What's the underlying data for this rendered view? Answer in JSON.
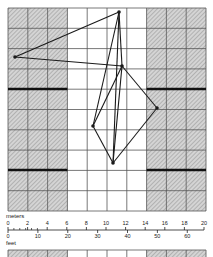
{
  "grid": {
    "left": 8,
    "top": 8,
    "right": 206,
    "bottom": 211,
    "cols": 10,
    "rows": 10,
    "hatched_columns_left": [
      0,
      1,
      2
    ],
    "hatched_columns_right": [
      7,
      8,
      9
    ],
    "bold_rows_y": [
      89,
      170
    ],
    "hatch_color": "#b8b8b8",
    "line_color": "#555555"
  },
  "figure": {
    "vertices": [
      {
        "id": "top",
        "x": 119,
        "y": 12
      },
      {
        "id": "left",
        "x": 15,
        "y": 57
      },
      {
        "id": "center",
        "x": 122,
        "y": 66
      },
      {
        "id": "right",
        "x": 157,
        "y": 108
      },
      {
        "id": "mid-left",
        "x": 93,
        "y": 126
      },
      {
        "id": "bottom",
        "x": 113,
        "y": 163
      }
    ],
    "edges": [
      [
        "top",
        "left"
      ],
      [
        "left",
        "center"
      ],
      [
        "top",
        "center"
      ],
      [
        "top",
        "mid-left"
      ],
      [
        "top",
        "bottom"
      ],
      [
        "center",
        "mid-left"
      ],
      [
        "center",
        "bottom"
      ],
      [
        "center",
        "right"
      ],
      [
        "right",
        "bottom"
      ],
      [
        "mid-left",
        "bottom"
      ]
    ],
    "stroke_color": "#1a1a1a"
  },
  "scale": {
    "meters_label": "meters",
    "feet_label": "feet",
    "meter_ticks": [
      "0",
      "2",
      "4",
      "6",
      "8",
      "10",
      "12",
      "14",
      "16",
      "18",
      "20"
    ],
    "feet_ticks": [
      "0",
      "10",
      "20",
      "30",
      "40",
      "50",
      "60"
    ]
  }
}
